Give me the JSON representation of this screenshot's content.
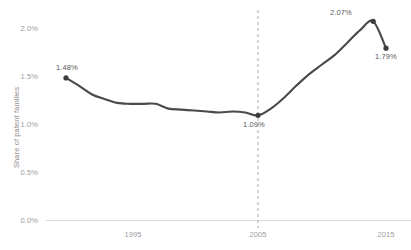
{
  "chart_data": {
    "type": "line",
    "title": "",
    "xlabel": "",
    "ylabel": "Share of patent families",
    "xlim": [
      1990,
      2015
    ],
    "ylim": [
      0.0,
      2.0
    ],
    "grid": false,
    "legend": null,
    "x_ticks": [
      "1995",
      "2005",
      "2015"
    ],
    "x_tick_values": [
      1995,
      2005,
      2015
    ],
    "y_ticks": [
      "0.0%",
      "0.5%",
      "1.0%",
      "1.5%",
      "2.0%"
    ],
    "y_tick_values": [
      0.0,
      0.5,
      1.0,
      1.5,
      2.0
    ],
    "line_color": "#4a4a4a",
    "marker_color": "#3d3d3d",
    "reference_line": {
      "x": 2005,
      "style": "dashed",
      "color": "#a8a8a8"
    },
    "series": [
      {
        "name": "Share of patent families",
        "x": [
          1990,
          1991,
          1992,
          1993,
          1994,
          1995,
          1996,
          1997,
          1998,
          1999,
          2000,
          2001,
          2002,
          2003,
          2004,
          2005,
          2006,
          2007,
          2008,
          2009,
          2010,
          2011,
          2012,
          2013,
          2014,
          2015
        ],
        "values": [
          1.48,
          1.4,
          1.31,
          1.26,
          1.22,
          1.21,
          1.21,
          1.21,
          1.16,
          1.15,
          1.14,
          1.13,
          1.12,
          1.13,
          1.12,
          1.09,
          1.16,
          1.27,
          1.4,
          1.52,
          1.62,
          1.72,
          1.85,
          1.98,
          2.07,
          1.79
        ]
      }
    ],
    "annotations": [
      {
        "label": "1.48%",
        "x": 1990,
        "y": 1.48,
        "marker": true
      },
      {
        "label": "1.09%",
        "x": 2005,
        "y": 1.09,
        "marker": true
      },
      {
        "label": "2.07%",
        "x": 2014,
        "y": 2.07,
        "marker": true
      },
      {
        "label": "1.79%",
        "x": 2015,
        "y": 1.79,
        "marker": true
      }
    ]
  },
  "axis": {
    "y_label": "Share of patent families",
    "y_tick_0": "0.0%",
    "y_tick_1": "0.5%",
    "y_tick_2": "1.0%",
    "y_tick_3": "1.5%",
    "y_tick_4": "2.0%",
    "x_tick_0": "1995",
    "x_tick_1": "2005",
    "x_tick_2": "2015"
  },
  "labels": {
    "start": "1.48%",
    "trough": "1.09%",
    "peak": "2.07%",
    "end": "1.79%"
  }
}
